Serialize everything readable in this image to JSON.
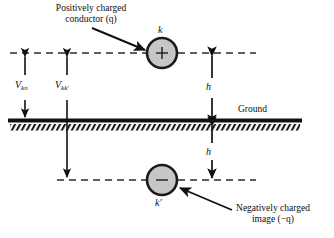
{
  "diagram": {
    "title_top_line1": "Positively charged",
    "title_top_line2": "conductor (q)",
    "title_bottom_line1": "Negatively charged",
    "title_bottom_line2": "image (−q)",
    "ground_label": "Ground",
    "node_top_label": "k",
    "node_bottom_label": "k′",
    "charge_top_symbol": "+",
    "charge_bottom_symbol": "−",
    "height_upper_label": "h",
    "height_lower_label": "h",
    "voltage_left": {
      "symbol": "V",
      "subscript": "kn"
    },
    "voltage_right": {
      "symbol": "V",
      "subscript": "kk′"
    },
    "colors": {
      "ink": "#0d0d0d",
      "conductor_fill": "#c6c6c6",
      "conductor_stroke": "#1a1a1a",
      "dash_line": "#2b2b2b",
      "ground_line": "#111111",
      "background": "#ffffff"
    },
    "geometry": {
      "top_dash_y": 53,
      "ground_y": 120,
      "bottom_dash_y": 180,
      "node_top_cx": 162,
      "node_top_cy": 53,
      "node_bottom_cx": 162,
      "node_bottom_cy": 180,
      "node_radius": 15,
      "v_kn_x": 25,
      "v_kk_x": 67,
      "h_arrow_x": 212
    }
  }
}
